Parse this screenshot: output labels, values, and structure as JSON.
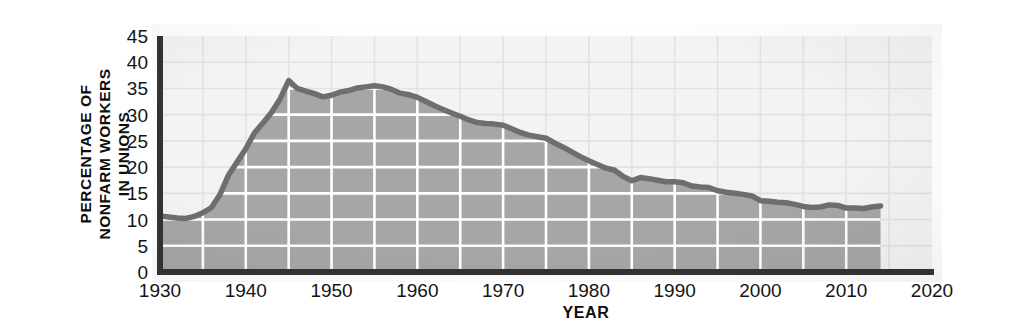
{
  "chart_data": {
    "type": "area",
    "title": "",
    "xlabel": "YEAR",
    "ylabel": "PERCENTAGE OF NONFARM WORKERS IN UNIONS",
    "ylabel_lines": [
      "PERCENTAGE OF",
      "NONFARM WORKERS",
      "IN UNIONS"
    ],
    "xlim": [
      1930,
      2020
    ],
    "ylim": [
      0,
      45
    ],
    "xticks": [
      1930,
      1940,
      1950,
      1960,
      1970,
      1980,
      1990,
      2000,
      2010,
      2020
    ],
    "xtick_labels": [
      "1930",
      "1940",
      "1950",
      "1960",
      "1970",
      "1980",
      "1990",
      "2000",
      "2010",
      "2020"
    ],
    "yticks": [
      0,
      5,
      10,
      15,
      20,
      25,
      30,
      35,
      40,
      45
    ],
    "ytick_labels": [
      "0",
      "5",
      "10",
      "15",
      "20",
      "25",
      "30",
      "35",
      "40",
      "45"
    ],
    "x_minor_step": 5,
    "y_minor_step": 5,
    "grid": true,
    "legend": "none",
    "series_name": "Percentage of nonfarm workers in unions",
    "x": [
      1930,
      1931,
      1932,
      1933,
      1934,
      1935,
      1936,
      1937,
      1938,
      1939,
      1940,
      1941,
      1942,
      1943,
      1944,
      1945,
      1946,
      1947,
      1948,
      1949,
      1950,
      1951,
      1952,
      1953,
      1954,
      1955,
      1956,
      1957,
      1958,
      1959,
      1960,
      1961,
      1962,
      1963,
      1964,
      1965,
      1966,
      1967,
      1968,
      1969,
      1970,
      1971,
      1972,
      1973,
      1974,
      1975,
      1976,
      1977,
      1978,
      1979,
      1980,
      1981,
      1982,
      1983,
      1984,
      1985,
      1986,
      1987,
      1988,
      1989,
      1990,
      1991,
      1992,
      1993,
      1994,
      1995,
      1996,
      1997,
      1998,
      1999,
      2000,
      2001,
      2002,
      2003,
      2004,
      2005,
      2006,
      2007,
      2008,
      2009,
      2010,
      2011,
      2012,
      2013,
      2014
    ],
    "values": [
      10.7,
      10.5,
      10.3,
      10.2,
      10.6,
      11.3,
      12.3,
      14.8,
      18.5,
      21.0,
      23.5,
      26.5,
      28.4,
      30.4,
      33.0,
      36.5,
      35.0,
      34.5,
      34.0,
      33.4,
      33.7,
      34.3,
      34.6,
      35.1,
      35.3,
      35.5,
      35.3,
      34.8,
      34.1,
      33.8,
      33.3,
      32.5,
      31.7,
      31.0,
      30.3,
      29.7,
      29.0,
      28.5,
      28.3,
      28.2,
      28.0,
      27.3,
      26.6,
      26.1,
      25.8,
      25.5,
      24.6,
      23.8,
      22.9,
      22.0,
      21.2,
      20.5,
      19.8,
      19.4,
      18.2,
      17.4,
      18.0,
      17.8,
      17.5,
      17.2,
      17.2,
      17.0,
      16.4,
      16.2,
      16.1,
      15.5,
      15.2,
      15.0,
      14.8,
      14.5,
      13.6,
      13.5,
      13.3,
      13.2,
      12.9,
      12.5,
      12.3,
      12.4,
      12.8,
      12.7,
      12.2,
      12.2,
      12.1,
      12.4,
      12.6
    ],
    "data_end_year": 2014
  },
  "style": {
    "area_fill": "#a6a6a6",
    "plot_above_fill": "#f3f3f3",
    "line_color": "#6e6e6e",
    "axis_color": "#333333",
    "grid_in_area": "#ffffff",
    "grid_above": "#e2e2e2",
    "text_color": "#141414"
  }
}
